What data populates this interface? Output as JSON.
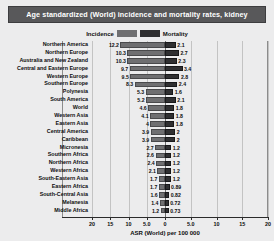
{
  "title": "Age standardized (World) incidence and mortality rates, kidney",
  "legend": {
    "incidence_label": "Incidence",
    "mortality_label": "Mortality",
    "incidence_color": "#6f6f71",
    "mortality_color": "#2f2f31"
  },
  "axis": {
    "title": "ASR (World) per 100 000",
    "ticks": [
      "20",
      "15",
      "10",
      "5.0",
      "0",
      "5.0",
      "10",
      "15",
      "20"
    ],
    "tick_values": [
      -20,
      -15,
      -10,
      -5,
      0,
      5,
      10,
      15,
      20
    ]
  },
  "chart_data": {
    "type": "bar",
    "orientation": "horizontal",
    "layout": "back-to-back",
    "title": "Age standardized (World) incidence and mortality rates, kidney",
    "xlabel": "ASR (World) per 100 000",
    "ylabel": "",
    "xlim": [
      -20,
      20
    ],
    "grid": true,
    "legend_position": "top-center",
    "categories": [
      "Northern America",
      "Northern Europe",
      "Australia and New Zealand",
      "Central and Eastern Europe",
      "Western Europe",
      "Southern Europe",
      "Polynesia",
      "South America",
      "World",
      "Western Asia",
      "Eastern Asia",
      "Central America",
      "Caribbean",
      "Micronesia",
      "Southern Africa",
      "Northern Africa",
      "Western Africa",
      "South-Eastern Asia",
      "Eastern Africa",
      "South-Central Asia",
      "Melanesia",
      "Middle Africa"
    ],
    "series": [
      {
        "name": "Incidence",
        "direction": "left",
        "color": "#6f6f71",
        "values": [
          12.2,
          10.3,
          10.3,
          9.7,
          9.5,
          8.3,
          5.3,
          5.2,
          4.6,
          4.1,
          4.0,
          3.9,
          3.9,
          2.7,
          2.6,
          2.4,
          2.1,
          1.7,
          1.7,
          1.6,
          1.4,
          1.2
        ]
      },
      {
        "name": "Mortality",
        "direction": "right",
        "color": "#2f2f31",
        "values": [
          2.1,
          2.7,
          2.3,
          3.4,
          2.8,
          2.4,
          1.6,
          2.1,
          1.8,
          1.8,
          1.8,
          2.0,
          2.0,
          1.2,
          1.2,
          1.2,
          1.2,
          1.2,
          0.89,
          0.82,
          0.72,
          0.73
        ]
      }
    ]
  }
}
